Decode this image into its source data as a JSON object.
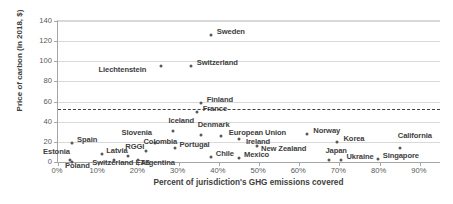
{
  "chart_data": {
    "type": "scatter",
    "title": "",
    "xlabel": "Percent of jurisdiction's GHG emissions covered",
    "ylabel": "Price of carbon (in 2018, $)",
    "xlim": [
      0,
      95
    ],
    "ylim": [
      0,
      140
    ],
    "xticks": [
      "0%",
      "10%",
      "20%",
      "30%",
      "40%",
      "50%",
      "60%",
      "70%",
      "80%",
      "90%"
    ],
    "xtick_values": [
      0,
      10,
      20,
      30,
      40,
      50,
      60,
      70,
      80,
      90
    ],
    "yticks": [
      "0",
      "20",
      "40",
      "60",
      "80",
      "100",
      "120",
      "140"
    ],
    "ytick_values": [
      0,
      20,
      40,
      60,
      80,
      100,
      120,
      140
    ],
    "grid": "horizontal",
    "legend": "none",
    "reference_line": {
      "name": "carbon-price-benchmark",
      "orientation": "horizontal",
      "value": 53,
      "style": "dashed"
    },
    "points": [
      {
        "name": "Sweden",
        "x": 38.0,
        "y": 126,
        "label_dx": 6,
        "label_dy": -4
      },
      {
        "name": "Switzerland",
        "x": 33.0,
        "y": 95,
        "label_dx": 6,
        "label_dy": -4
      },
      {
        "name": "Liechtenstein",
        "x": 25.5,
        "y": 95,
        "label_dx": -62,
        "label_dy": 3
      },
      {
        "name": "Finland",
        "x": 35.5,
        "y": 59,
        "label_dx": 6,
        "label_dy": -4
      },
      {
        "name": "France",
        "x": 34.5,
        "y": 50,
        "label_dx": 6,
        "label_dy": -4
      },
      {
        "name": "Denmark",
        "x": 35.5,
        "y": 27,
        "label_dx": -3,
        "label_dy": -11
      },
      {
        "name": "Iceland",
        "x": 28.5,
        "y": 31,
        "label_dx": -4,
        "label_dy": -11
      },
      {
        "name": "Slovenia",
        "x": 24.0,
        "y": 19,
        "label_dx": -33,
        "label_dy": -11
      },
      {
        "name": "European Union",
        "x": 40.5,
        "y": 26,
        "label_dx": 8,
        "label_dy": -4
      },
      {
        "name": "Norway",
        "x": 62.0,
        "y": 28,
        "label_dx": 6,
        "label_dy": -4
      },
      {
        "name": "Ireland",
        "x": 45.0,
        "y": 23,
        "label_dx": 7,
        "label_dy": 2
      },
      {
        "name": "Korea",
        "x": 69.5,
        "y": 20,
        "label_dx": 6,
        "label_dy": -4
      },
      {
        "name": "California",
        "x": 85.0,
        "y": 14,
        "label_dx": -2,
        "label_dy": -13
      },
      {
        "name": "Portugal",
        "x": 29.0,
        "y": 14,
        "label_dx": 5,
        "label_dy": -4
      },
      {
        "name": "Spain",
        "x": 3.5,
        "y": 19,
        "label_dx": 5,
        "label_dy": -4
      },
      {
        "name": "Colombia",
        "x": 22.0,
        "y": 11,
        "label_dx": -3,
        "label_dy": -10
      },
      {
        "name": "New Zealand",
        "x": 49.5,
        "y": 16,
        "label_dx": 4,
        "label_dy": 2
      },
      {
        "name": "Latvia",
        "x": 11.0,
        "y": 8,
        "label_dx": 4,
        "label_dy": -4
      },
      {
        "name": "RGGI",
        "x": 17.5,
        "y": 6,
        "label_dx": -3,
        "label_dy": -10
      },
      {
        "name": "Estonia",
        "x": 3.0,
        "y": 2,
        "label_dx": -27,
        "label_dy": -9
      },
      {
        "name": "Chile",
        "x": 38.0,
        "y": 5,
        "label_dx": 5,
        "label_dy": -4
      },
      {
        "name": "Mexico",
        "x": 45.0,
        "y": 4,
        "label_dx": 5,
        "label_dy": -4
      },
      {
        "name": "Japan",
        "x": 67.5,
        "y": 2,
        "label_dx": -4,
        "label_dy": -10
      },
      {
        "name": "Ukraine",
        "x": 70.5,
        "y": 2,
        "label_dx": 5,
        "label_dy": -4
      },
      {
        "name": "Singapore",
        "x": 79.5,
        "y": 3,
        "label_dx": 5,
        "label_dy": -4
      },
      {
        "name": "Switzerland ETS",
        "x": 14.0,
        "y": 2,
        "label_dx": -22,
        "label_dy": 2
      },
      {
        "name": "Argentina",
        "x": 20.0,
        "y": 2,
        "label_dx": 2,
        "label_dy": 2
      },
      {
        "name": "Poland",
        "x": 3.5,
        "y": 0,
        "label_dx": -7,
        "label_dy": 3
      }
    ],
    "unlabeled_points": [
      {
        "name": "above-axis-outlier",
        "x": 5.0,
        "y": 168
      }
    ]
  }
}
